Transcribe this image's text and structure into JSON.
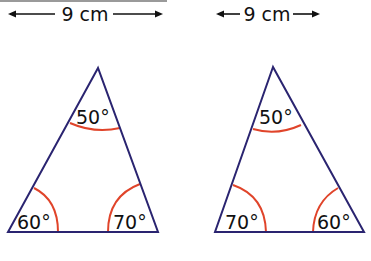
{
  "colors": {
    "triangle_edge": "#2a2470",
    "angle_arc": "#e0442a",
    "text": "#111111",
    "top_rule": "#9a9a9a"
  },
  "diagram": {
    "left": {
      "dimension_label": "9 cm",
      "angles": {
        "top": "50°",
        "bottom_left": "60°",
        "bottom_right": "70°"
      }
    },
    "right": {
      "dimension_label": "9 cm",
      "angles": {
        "top": "50°",
        "bottom_left": "70°",
        "bottom_right": "60°"
      }
    }
  }
}
